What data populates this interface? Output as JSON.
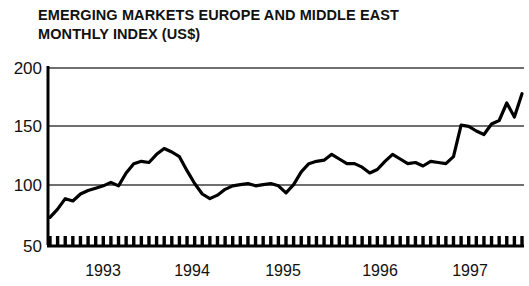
{
  "chart_data": {
    "type": "line",
    "title": "EMERGING MARKETS EUROPE AND MIDDLE EAST\nMONTHLY INDEX (US$)",
    "title_line_1": "EMERGING MARKETS EUROPE AND MIDDLE EAST",
    "title_line_2": "MONTHLY INDEX (US$)",
    "xlabel": "",
    "ylabel": "",
    "ylim": [
      50,
      200
    ],
    "yticks": [
      50,
      100,
      150,
      200
    ],
    "ytick_labels": [
      "50",
      "100",
      "150",
      "200"
    ],
    "xtick_labels": [
      "1993",
      "1994",
      "1995",
      "1996",
      "1997"
    ],
    "xtick_years": [
      1993,
      1994,
      1995,
      1996,
      1997
    ],
    "grid": "horizontal",
    "legend": "none",
    "line_color": "#000000",
    "grid_color": "#7a7a7a",
    "axis_color": "#000000",
    "background_color": "#ffffff",
    "minor_ticks": "monthly",
    "x_start": "1992-09",
    "x_end": "1997-11",
    "x": [
      "1992-09",
      "1992-10",
      "1992-11",
      "1992-12",
      "1993-01",
      "1993-02",
      "1993-03",
      "1993-04",
      "1993-05",
      "1993-06",
      "1993-07",
      "1993-08",
      "1993-09",
      "1993-10",
      "1993-11",
      "1993-12",
      "1994-01",
      "1994-02",
      "1994-03",
      "1994-04",
      "1994-05",
      "1994-06",
      "1994-07",
      "1994-08",
      "1994-09",
      "1994-10",
      "1994-11",
      "1994-12",
      "1995-01",
      "1995-02",
      "1995-03",
      "1995-04",
      "1995-05",
      "1995-06",
      "1995-07",
      "1995-08",
      "1995-09",
      "1995-10",
      "1995-11",
      "1995-12",
      "1996-01",
      "1996-02",
      "1996-03",
      "1996-04",
      "1996-05",
      "1996-06",
      "1996-07",
      "1996-08",
      "1996-09",
      "1996-10",
      "1996-11",
      "1996-12",
      "1997-01",
      "1997-02",
      "1997-03",
      "1997-04",
      "1997-05",
      "1997-06",
      "1997-07",
      "1997-08",
      "1997-09",
      "1997-10",
      "1997-11"
    ],
    "values": [
      72,
      79,
      88,
      86,
      92,
      95,
      97,
      99,
      102,
      99,
      110,
      118,
      120,
      119,
      126,
      131,
      128,
      124,
      112,
      101,
      92,
      88,
      91,
      96,
      99,
      100,
      101,
      99,
      100,
      101,
      99,
      93,
      100,
      111,
      118,
      120,
      121,
      126,
      122,
      118,
      118,
      115,
      110,
      113,
      120,
      126,
      122,
      118,
      119,
      116,
      120,
      119,
      118,
      124,
      151,
      150,
      146,
      143,
      152,
      155,
      170,
      158,
      178
    ]
  }
}
